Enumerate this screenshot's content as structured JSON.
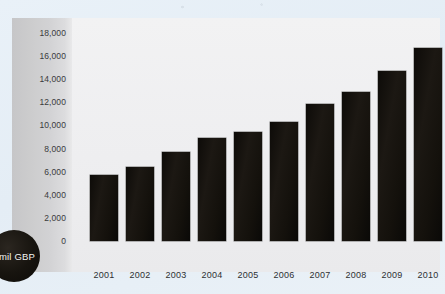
{
  "chart_data": {
    "type": "bar",
    "title": "",
    "xlabel": "",
    "ylabel": "mil GBP",
    "categories": [
      "2001",
      "2002",
      "2003",
      "2004",
      "2005",
      "2006",
      "2007",
      "2008",
      "2009",
      "2010"
    ],
    "values": [
      5700,
      6400,
      7700,
      8900,
      9400,
      10300,
      11900,
      12900,
      14700,
      16700
    ],
    "ylim": [
      0,
      18000
    ],
    "yticks": [
      0,
      2000,
      4000,
      6000,
      8000,
      10000,
      12000,
      14000,
      16000,
      18000
    ],
    "ytick_labels": [
      "0",
      "2,000",
      "4,000",
      "6,000",
      "8,000",
      "10,000",
      "12,000",
      "14,000",
      "16,000",
      "18,000"
    ],
    "grid": false,
    "legend": null,
    "series": [
      {
        "name": "mil GBP",
        "color": "#141109",
        "values": [
          5700,
          6400,
          7700,
          8900,
          9400,
          10300,
          11900,
          12900,
          14700,
          16700
        ]
      }
    ]
  },
  "badge": {
    "label": "mil GBP",
    "color": "#14110c",
    "text_color": "#f4f4f2"
  },
  "colors": {
    "page_background": "#e7eff7",
    "panel_background": "#eeeef0",
    "axis_strip": "#cfcfd1",
    "bar": "#141109",
    "tick_text": "#3a3a3c"
  }
}
